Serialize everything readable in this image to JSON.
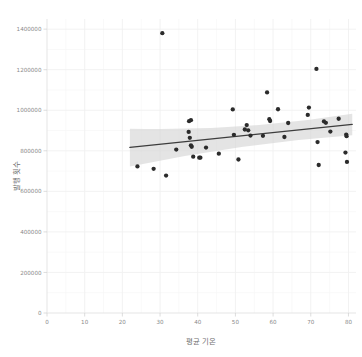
{
  "chart_data": {
    "type": "scatter",
    "title": "",
    "xlabel": "평균 기온",
    "ylabel": "발행 횟수",
    "xlim": [
      0,
      82
    ],
    "ylim": [
      0,
      1450000
    ],
    "grid": true,
    "legend": null,
    "xticks": [
      0,
      10,
      20,
      30,
      40,
      50,
      60,
      70,
      80
    ],
    "xtick_labels": [
      "0",
      "10",
      "20",
      "30",
      "40",
      "50",
      "60",
      "70",
      "80"
    ],
    "yticks": [
      0,
      200000,
      400000,
      600000,
      800000,
      1000000,
      1200000,
      1400000
    ],
    "ytick_labels": [
      "0",
      "200000",
      "400000",
      "600000",
      "800000",
      "1000000",
      "1200000",
      "1400000"
    ],
    "point_color": "#2b2b2b",
    "line_color": "#3d3d3d",
    "band_color": "#d4d4d4",
    "grid_color": "#f0f0f0",
    "background_color": "#ffffff",
    "points": [
      {
        "x": 24.0,
        "y": 723000
      },
      {
        "x": 28.3,
        "y": 711000
      },
      {
        "x": 30.6,
        "y": 1380000
      },
      {
        "x": 31.6,
        "y": 678000
      },
      {
        "x": 34.3,
        "y": 806000
      },
      {
        "x": 37.6,
        "y": 893000
      },
      {
        "x": 37.7,
        "y": 946000
      },
      {
        "x": 37.9,
        "y": 864000
      },
      {
        "x": 38.2,
        "y": 951000
      },
      {
        "x": 38.2,
        "y": 827000
      },
      {
        "x": 38.4,
        "y": 820000
      },
      {
        "x": 38.8,
        "y": 771000
      },
      {
        "x": 40.4,
        "y": 766000
      },
      {
        "x": 40.7,
        "y": 766000
      },
      {
        "x": 42.2,
        "y": 816000
      },
      {
        "x": 45.6,
        "y": 786000
      },
      {
        "x": 49.3,
        "y": 1004000
      },
      {
        "x": 49.6,
        "y": 879000
      },
      {
        "x": 50.8,
        "y": 757000
      },
      {
        "x": 52.5,
        "y": 905000
      },
      {
        "x": 53.0,
        "y": 927000
      },
      {
        "x": 53.4,
        "y": 901000
      },
      {
        "x": 54.0,
        "y": 875000
      },
      {
        "x": 57.3,
        "y": 874000
      },
      {
        "x": 58.4,
        "y": 1088000
      },
      {
        "x": 59.0,
        "y": 956000
      },
      {
        "x": 59.2,
        "y": 947000
      },
      {
        "x": 61.3,
        "y": 1005000
      },
      {
        "x": 63.0,
        "y": 868000
      },
      {
        "x": 64.0,
        "y": 937000
      },
      {
        "x": 69.2,
        "y": 977000
      },
      {
        "x": 69.5,
        "y": 1013000
      },
      {
        "x": 71.5,
        "y": 1204000
      },
      {
        "x": 71.8,
        "y": 843000
      },
      {
        "x": 72.1,
        "y": 730000
      },
      {
        "x": 73.5,
        "y": 945000
      },
      {
        "x": 74.0,
        "y": 938000
      },
      {
        "x": 75.2,
        "y": 895000
      },
      {
        "x": 77.4,
        "y": 958000
      },
      {
        "x": 79.2,
        "y": 791000
      },
      {
        "x": 79.4,
        "y": 880000
      },
      {
        "x": 79.5,
        "y": 872000
      },
      {
        "x": 79.6,
        "y": 745000
      }
    ],
    "fit_line": {
      "x_start": 22.0,
      "y_start": 817000,
      "x_end": 81.0,
      "y_end": 930000
    },
    "confidence_band": {
      "x_start": 22.0,
      "x_end": 81.0,
      "upper_start": 909000,
      "upper_end": 983000,
      "lower_start": 722000,
      "lower_end": 877000,
      "upper_mid": 895000,
      "lower_mid": 838000
    }
  }
}
